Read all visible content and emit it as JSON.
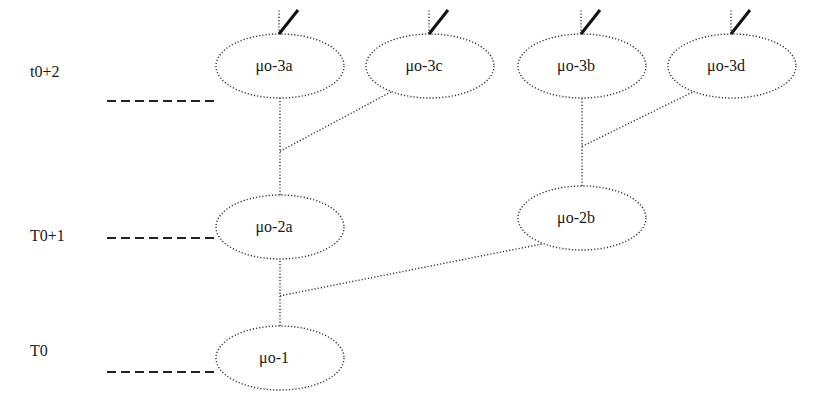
{
  "diagram": {
    "type": "tree",
    "time_levels": [
      {
        "id": "L2",
        "label": "t0+2"
      },
      {
        "id": "L1",
        "label": "T0+1"
      },
      {
        "id": "L0",
        "label": "T0"
      }
    ],
    "nodes": [
      {
        "id": "n3a",
        "label": "μo-3a",
        "level": "L2",
        "checked": true
      },
      {
        "id": "n3c",
        "label": "μo-3c",
        "level": "L2",
        "checked": true
      },
      {
        "id": "n3b",
        "label": "μo-3b",
        "level": "L2",
        "checked": true
      },
      {
        "id": "n3d",
        "label": "μo-3d",
        "level": "L2",
        "checked": true
      },
      {
        "id": "n2a",
        "label": "μo-2a",
        "level": "L1",
        "checked": false
      },
      {
        "id": "n2b",
        "label": "μo-2b",
        "level": "L1",
        "checked": false
      },
      {
        "id": "n1",
        "label": "μo-1",
        "level": "L0",
        "checked": false
      }
    ],
    "edges": [
      {
        "from": "n1",
        "to": "n2a"
      },
      {
        "from": "n1",
        "to": "n2b"
      },
      {
        "from": "n2a",
        "to": "n3a"
      },
      {
        "from": "n2a",
        "to": "n3c"
      },
      {
        "from": "n2b",
        "to": "n3b"
      },
      {
        "from": "n2b",
        "to": "n3d"
      }
    ]
  }
}
